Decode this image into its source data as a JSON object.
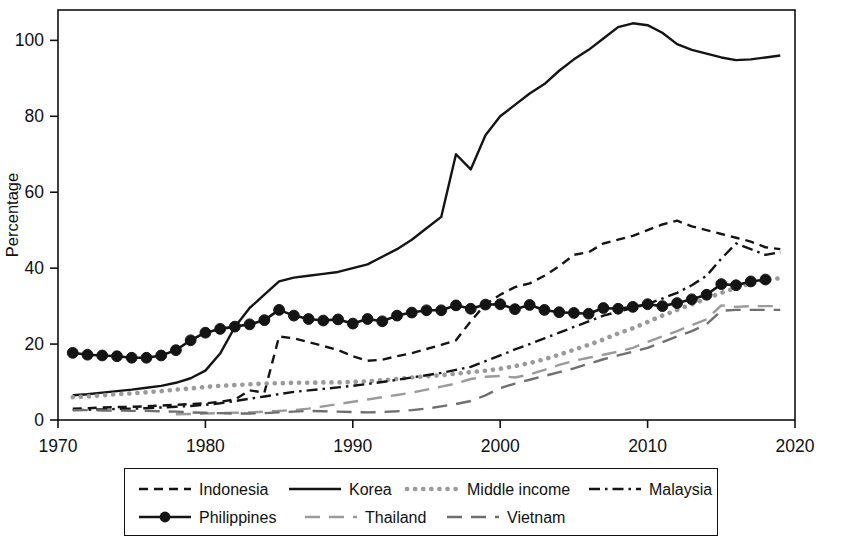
{
  "figure": {
    "title": "",
    "axis": {
      "ylabel": "Percentage",
      "xlabel": "",
      "y_ticks": [
        0,
        20,
        40,
        60,
        80,
        100
      ],
      "x_ticks": [
        1970,
        1980,
        1990,
        2000,
        2010,
        2020
      ],
      "xlim": [
        1970,
        2020
      ],
      "ylim": [
        0,
        108
      ],
      "grid": "none",
      "frame": "box"
    },
    "legend": {
      "position": "below-plot",
      "border": true,
      "rows": [
        [
          "Indonesia",
          "Korea",
          "Middle income",
          "Malaysia"
        ],
        [
          "Philippines",
          "Thailand",
          "Vietnam"
        ]
      ]
    },
    "colors": {
      "dark": "#141414",
      "gray": "#9a9a9a",
      "mid_gray": "#6f6f6f",
      "frame": "#111111",
      "background": "#ffffff"
    }
  },
  "chart_data": {
    "type": "line",
    "title": "",
    "xlabel": "",
    "ylabel": "Percentage",
    "xlim": [
      1970,
      2020
    ],
    "ylim": [
      0,
      108
    ],
    "grid": false,
    "legend_position": "bottom",
    "x_ticks": [
      1970,
      1980,
      1990,
      2000,
      2010,
      2020
    ],
    "y_ticks": [
      0,
      20,
      40,
      60,
      80,
      100
    ],
    "series": [
      {
        "name": "Indonesia",
        "style": "dashed",
        "color": "#141414",
        "marker": "none",
        "x": [
          1971,
          1972,
          1973,
          1974,
          1975,
          1976,
          1977,
          1978,
          1979,
          1980,
          1981,
          1982,
          1983,
          1984,
          1985,
          1986,
          1987,
          1988,
          1989,
          1990,
          1991,
          1992,
          1993,
          1994,
          1995,
          1996,
          1997,
          1998,
          1999,
          2000,
          2001,
          2002,
          2003,
          2004,
          2005,
          2006,
          2007,
          2008,
          2009,
          2010,
          2011,
          2012,
          2013,
          2014,
          2015,
          2016,
          2017,
          2018,
          2019
        ],
        "values": [
          3.0,
          3.1,
          3.3,
          3.4,
          3.5,
          3.6,
          3.8,
          4.0,
          4.2,
          4.4,
          4.8,
          5.4,
          7.8,
          7.2,
          22.0,
          21.5,
          20.5,
          19.5,
          18.4,
          16.8,
          15.6,
          15.9,
          16.8,
          17.6,
          18.7,
          19.8,
          21.0,
          26.0,
          30.5,
          33.0,
          35.0,
          36.0,
          38.0,
          40.5,
          43.5,
          44.2,
          46.5,
          47.5,
          48.5,
          50.0,
          51.5,
          52.5,
          51.0,
          50.0,
          49.0,
          48.0,
          47.0,
          45.5,
          45.0
        ]
      },
      {
        "name": "Korea",
        "style": "solid",
        "color": "#141414",
        "marker": "none",
        "x": [
          1971,
          1972,
          1973,
          1974,
          1975,
          1976,
          1977,
          1978,
          1979,
          1980,
          1981,
          1982,
          1983,
          1984,
          1985,
          1986,
          1987,
          1988,
          1989,
          1990,
          1991,
          1992,
          1993,
          1994,
          1995,
          1996,
          1997,
          1998,
          1999,
          2000,
          2001,
          2002,
          2003,
          2004,
          2005,
          2006,
          2007,
          2008,
          2009,
          2010,
          2011,
          2012,
          2013,
          2014,
          2015,
          2016,
          2017,
          2018,
          2019
        ],
        "values": [
          6.5,
          6.8,
          7.2,
          7.6,
          8.0,
          8.5,
          9.0,
          9.8,
          11.0,
          13.0,
          17.5,
          24.5,
          29.5,
          33.0,
          36.5,
          37.5,
          38.0,
          38.5,
          39.0,
          40.0,
          41.0,
          43.0,
          45.0,
          47.5,
          50.5,
          53.5,
          70.0,
          66.0,
          75.0,
          80.0,
          83.0,
          86.0,
          88.5,
          92.0,
          95.0,
          97.5,
          100.5,
          103.5,
          104.5,
          104.0,
          102.0,
          99.0,
          97.5,
          96.5,
          95.5,
          94.8,
          95.0,
          95.5,
          96.0
        ]
      },
      {
        "name": "Middle income",
        "style": "dotted",
        "color": "#9a9a9a",
        "marker": "none",
        "x": [
          1971,
          1972,
          1973,
          1974,
          1975,
          1976,
          1977,
          1978,
          1979,
          1980,
          1981,
          1982,
          1983,
          1984,
          1985,
          1986,
          1987,
          1988,
          1989,
          1990,
          1991,
          1992,
          1993,
          1994,
          1995,
          1996,
          1997,
          1998,
          1999,
          2000,
          2001,
          2002,
          2003,
          2004,
          2005,
          2006,
          2007,
          2008,
          2009,
          2010,
          2011,
          2012,
          2013,
          2014,
          2015,
          2016,
          2017,
          2018,
          2019
        ],
        "values": [
          6.0,
          6.2,
          6.5,
          6.8,
          7.0,
          7.3,
          7.6,
          8.0,
          8.3,
          8.7,
          9.0,
          9.2,
          9.4,
          9.6,
          9.7,
          9.8,
          9.8,
          9.9,
          9.9,
          10.0,
          10.2,
          10.5,
          10.8,
          11.2,
          11.5,
          11.8,
          12.2,
          12.6,
          13.0,
          13.5,
          14.2,
          15.0,
          16.0,
          17.2,
          18.5,
          19.8,
          21.2,
          22.8,
          24.2,
          25.8,
          27.5,
          29.0,
          30.5,
          32.0,
          33.5,
          34.8,
          36.0,
          36.8,
          37.4
        ]
      },
      {
        "name": "Malaysia",
        "style": "dashdot",
        "color": "#141414",
        "marker": "none",
        "x": [
          1971,
          1972,
          1973,
          1974,
          1975,
          1976,
          1977,
          1978,
          1979,
          1980,
          1981,
          1982,
          1983,
          1984,
          1985,
          1986,
          1987,
          1988,
          1989,
          1990,
          1991,
          1992,
          1993,
          1994,
          1995,
          1996,
          1997,
          1998,
          1999,
          2000,
          2001,
          2002,
          2003,
          2004,
          2005,
          2006,
          2007,
          2008,
          2009,
          2010,
          2011,
          2012,
          2013,
          2014,
          2015,
          2016,
          2017,
          2018,
          2019
        ],
        "values": [
          2.6,
          2.7,
          2.8,
          2.9,
          3.0,
          3.1,
          3.3,
          3.5,
          3.7,
          4.0,
          4.4,
          5.0,
          5.6,
          6.2,
          6.8,
          7.4,
          7.8,
          8.2,
          8.6,
          9.0,
          9.5,
          10.0,
          10.6,
          11.2,
          11.8,
          12.4,
          13.2,
          14.0,
          15.5,
          17.0,
          18.6,
          20.0,
          21.5,
          23.0,
          24.5,
          26.0,
          27.5,
          28.5,
          29.5,
          30.5,
          32.0,
          33.5,
          35.5,
          38.0,
          42.5,
          46.5,
          45.0,
          43.5,
          44.2
        ]
      },
      {
        "name": "Philippines",
        "style": "solid",
        "color": "#141414",
        "marker": "circle",
        "x": [
          1971,
          1972,
          1973,
          1974,
          1975,
          1976,
          1977,
          1978,
          1979,
          1980,
          1981,
          1982,
          1983,
          1984,
          1985,
          1986,
          1987,
          1988,
          1989,
          1990,
          1991,
          1992,
          1993,
          1994,
          1995,
          1996,
          1997,
          1998,
          1999,
          2000,
          2001,
          2002,
          2003,
          2004,
          2005,
          2006,
          2007,
          2008,
          2009,
          2010,
          2011,
          2012,
          2013,
          2014,
          2015,
          2016,
          2017,
          2018
        ],
        "values": [
          17.7,
          17.2,
          17.0,
          16.8,
          16.4,
          16.4,
          17.0,
          18.4,
          21.0,
          23.0,
          24.0,
          24.6,
          25.2,
          26.3,
          29.0,
          27.5,
          26.6,
          26.2,
          26.5,
          25.4,
          26.6,
          26.0,
          27.5,
          28.3,
          28.9,
          28.9,
          30.2,
          29.3,
          30.4,
          30.5,
          29.2,
          30.3,
          29.0,
          28.4,
          28.2,
          28.0,
          29.5,
          29.3,
          29.8,
          30.5,
          30.0,
          30.8,
          31.8,
          33.0,
          35.8,
          35.5,
          36.5,
          37.0
        ]
      },
      {
        "name": "Thailand",
        "style": "longdash",
        "color": "#9a9a9a",
        "marker": "none",
        "x": [
          1978,
          1979,
          1980,
          1981,
          1982,
          1983,
          1984,
          1985,
          1986,
          1987,
          1988,
          1989,
          1990,
          1991,
          1992,
          1993,
          1994,
          1995,
          1996,
          1997,
          1998,
          1999,
          2000,
          2001,
          2002,
          2003,
          2004,
          2005,
          2006,
          2007,
          2008,
          2009,
          2010,
          2011,
          2012,
          2013,
          2014,
          2015,
          2016,
          2017,
          2018,
          2019
        ],
        "values": [
          1.5,
          1.6,
          1.7,
          1.8,
          1.9,
          2.0,
          2.2,
          2.4,
          2.6,
          3.0,
          3.6,
          4.2,
          4.8,
          5.4,
          6.0,
          6.6,
          7.2,
          8.0,
          8.8,
          9.6,
          10.8,
          11.4,
          11.6,
          11.2,
          12.0,
          13.2,
          14.5,
          15.6,
          16.4,
          17.2,
          18.0,
          19.0,
          20.6,
          22.0,
          23.4,
          25.0,
          26.5,
          30.2,
          29.8,
          30.0,
          30.0,
          30.0
        ]
      },
      {
        "name": "Vietnam",
        "style": "longdash",
        "color": "#6f6f6f",
        "marker": "none",
        "x": [
          1971,
          1972,
          1973,
          1974,
          1975,
          1976,
          1977,
          1978,
          1979,
          1980,
          1981,
          1982,
          1983,
          1984,
          1985,
          1986,
          1987,
          1988,
          1989,
          1990,
          1991,
          1992,
          1993,
          1994,
          1995,
          1996,
          1997,
          1998,
          1999,
          2000,
          2001,
          2002,
          2003,
          2004,
          2005,
          2006,
          2007,
          2008,
          2009,
          2010,
          2011,
          2012,
          2013,
          2014,
          2015,
          2016,
          2017,
          2018,
          2019
        ],
        "values": [
          2.6,
          2.6,
          2.5,
          2.5,
          2.4,
          2.4,
          2.3,
          2.2,
          2.0,
          1.9,
          1.8,
          1.7,
          1.7,
          1.8,
          2.0,
          2.2,
          2.4,
          2.3,
          2.2,
          2.1,
          2.0,
          2.1,
          2.3,
          2.6,
          3.0,
          3.6,
          4.2,
          5.0,
          6.5,
          8.4,
          9.6,
          10.6,
          11.6,
          12.6,
          13.6,
          14.8,
          16.0,
          17.0,
          18.0,
          19.0,
          20.5,
          22.0,
          23.4,
          25.2,
          28.8,
          29.0,
          29.0,
          29.0,
          29.0
        ]
      }
    ]
  }
}
